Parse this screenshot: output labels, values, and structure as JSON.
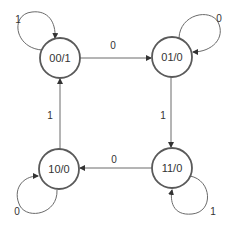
{
  "diagram": {
    "type": "state-machine",
    "states": [
      {
        "id": "s00",
        "label": "00/1",
        "cx": 60,
        "cy": 58
      },
      {
        "id": "s01",
        "label": "01/0",
        "cx": 172,
        "cy": 57
      },
      {
        "id": "s10",
        "label": "10/0",
        "cx": 59,
        "cy": 169
      },
      {
        "id": "s11",
        "label": "11/0",
        "cx": 172,
        "cy": 168
      }
    ],
    "transitions": [
      {
        "from": "00/1",
        "to": "00/1",
        "input": "1"
      },
      {
        "from": "00/1",
        "to": "01/0",
        "input": "0"
      },
      {
        "from": "01/0",
        "to": "01/0",
        "input": "0"
      },
      {
        "from": "01/0",
        "to": "11/0",
        "input": "1"
      },
      {
        "from": "11/0",
        "to": "11/0",
        "input": "1"
      },
      {
        "from": "11/0",
        "to": "10/0",
        "input": "0"
      },
      {
        "from": "10/0",
        "to": "10/0",
        "input": "0"
      },
      {
        "from": "10/0",
        "to": "00/1",
        "input": "1"
      }
    ],
    "labels": {
      "loop_00": "1",
      "edge_00_01": "0",
      "loop_01": "0",
      "edge_01_11": "1",
      "loop_11": "1",
      "edge_11_10": "0",
      "loop_10": "0",
      "edge_10_00": "1"
    },
    "colors": {
      "node_stroke": "#5a5a5a",
      "edge_stroke": "#6a6a6a",
      "text": "#333333"
    }
  }
}
